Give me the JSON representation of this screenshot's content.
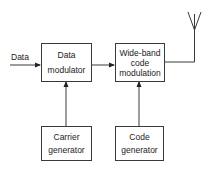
{
  "diagram": {
    "type": "block-diagram",
    "input_label": "Data",
    "blocks": [
      {
        "id": "data-modulator",
        "lines": [
          "Data",
          "modulator"
        ]
      },
      {
        "id": "wideband-code-modulation",
        "lines": [
          "Wide-band",
          "code",
          "modulation"
        ]
      },
      {
        "id": "carrier-generator",
        "lines": [
          "Carrier",
          "generator"
        ]
      },
      {
        "id": "code-generator",
        "lines": [
          "Code",
          "generator"
        ]
      }
    ],
    "connections": [
      {
        "from": "Data input",
        "to": "data-modulator"
      },
      {
        "from": "data-modulator",
        "to": "wideband-code-modulation"
      },
      {
        "from": "carrier-generator",
        "to": "data-modulator"
      },
      {
        "from": "code-generator",
        "to": "wideband-code-modulation"
      },
      {
        "from": "wideband-code-modulation",
        "to": "antenna"
      }
    ],
    "output": "antenna-icon",
    "colors": {
      "line": "#3a3a3a",
      "background": "#ffffff"
    }
  }
}
